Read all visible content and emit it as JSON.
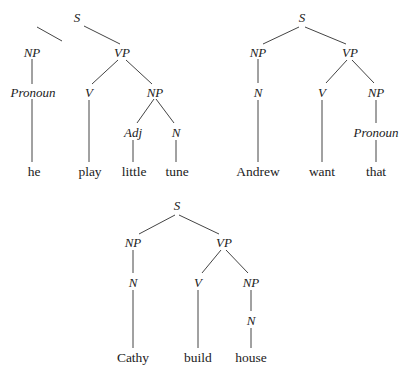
{
  "trees": [
    {
      "id": "tree-he-play-little-tune",
      "nodes": [
        {
          "id": "S",
          "label": "S",
          "type": "cat",
          "x": 77,
          "y": 17
        },
        {
          "id": "NP1",
          "label": "NP",
          "type": "cat",
          "x": 32,
          "y": 52
        },
        {
          "id": "VP",
          "label": "VP",
          "type": "cat",
          "x": 122,
          "y": 52
        },
        {
          "id": "Pron",
          "label": "Pronoun",
          "type": "cat",
          "x": 33,
          "y": 92
        },
        {
          "id": "V",
          "label": "V",
          "type": "cat",
          "x": 89,
          "y": 92
        },
        {
          "id": "NP2",
          "label": "NP",
          "type": "cat",
          "x": 155,
          "y": 92
        },
        {
          "id": "Adj",
          "label": "Adj",
          "type": "cat",
          "x": 133,
          "y": 132
        },
        {
          "id": "N",
          "label": "N",
          "type": "cat",
          "x": 176,
          "y": 132
        },
        {
          "id": "w1",
          "label": "he",
          "type": "word",
          "x": 34,
          "y": 172
        },
        {
          "id": "w2",
          "label": "play",
          "type": "word",
          "x": 90,
          "y": 172
        },
        {
          "id": "w3",
          "label": "little",
          "type": "word",
          "x": 134,
          "y": 172
        },
        {
          "id": "w4",
          "label": "tune",
          "type": "word",
          "x": 177,
          "y": 172
        }
      ],
      "edges": [
        [
          37,
          27,
          62,
          41,
          0
        ],
        [
          84,
          26,
          120,
          44,
          0
        ],
        [
          32,
          59,
          32,
          84,
          0
        ],
        [
          32,
          99,
          32,
          162,
          0
        ],
        [
          118,
          60,
          92,
          84,
          0
        ],
        [
          126,
          60,
          152,
          84,
          0
        ],
        [
          89,
          100,
          89,
          162,
          0
        ],
        [
          154,
          99,
          137,
          123,
          0
        ],
        [
          156,
          99,
          174,
          123,
          0
        ],
        [
          133,
          140,
          133,
          162,
          0
        ],
        [
          176,
          140,
          176,
          162,
          0
        ]
      ]
    },
    {
      "id": "tree-andrew-want-that",
      "nodes": [
        {
          "id": "S",
          "label": "S",
          "type": "cat",
          "x": 302,
          "y": 17
        },
        {
          "id": "NP1",
          "label": "NP",
          "type": "cat",
          "x": 258,
          "y": 52
        },
        {
          "id": "VP",
          "label": "VP",
          "type": "cat",
          "x": 350,
          "y": 52
        },
        {
          "id": "N",
          "label": "N",
          "type": "cat",
          "x": 258,
          "y": 92
        },
        {
          "id": "V",
          "label": "V",
          "type": "cat",
          "x": 322,
          "y": 92
        },
        {
          "id": "NP2",
          "label": "NP",
          "type": "cat",
          "x": 376,
          "y": 92
        },
        {
          "id": "Pron",
          "label": "Pronoun",
          "type": "cat",
          "x": 376,
          "y": 132
        },
        {
          "id": "w1",
          "label": "Andrew",
          "type": "word",
          "x": 258,
          "y": 172
        },
        {
          "id": "w2",
          "label": "want",
          "type": "word",
          "x": 322,
          "y": 172
        },
        {
          "id": "w3",
          "label": "that",
          "type": "word",
          "x": 376,
          "y": 172
        }
      ],
      "edges": [
        [
          299,
          27,
          263,
          44,
          0
        ],
        [
          305,
          27,
          346,
          44,
          0
        ],
        [
          258,
          59,
          258,
          83,
          0
        ],
        [
          258,
          100,
          258,
          162,
          0
        ],
        [
          347,
          60,
          326,
          83,
          0
        ],
        [
          352,
          60,
          374,
          83,
          0
        ],
        [
          322,
          100,
          322,
          162,
          0
        ],
        [
          376,
          100,
          376,
          123,
          0
        ],
        [
          376,
          140,
          376,
          162,
          0
        ]
      ]
    },
    {
      "id": "tree-cathy-build-house",
      "nodes": [
        {
          "id": "S",
          "label": "S",
          "type": "cat",
          "x": 177,
          "y": 205
        },
        {
          "id": "NP1",
          "label": "NP",
          "type": "cat",
          "x": 133,
          "y": 242
        },
        {
          "id": "VP",
          "label": "VP",
          "type": "cat",
          "x": 224,
          "y": 242
        },
        {
          "id": "N",
          "label": "N",
          "type": "cat",
          "x": 133,
          "y": 282
        },
        {
          "id": "V",
          "label": "V",
          "type": "cat",
          "x": 198,
          "y": 282
        },
        {
          "id": "NP2",
          "label": "NP",
          "type": "cat",
          "x": 251,
          "y": 282
        },
        {
          "id": "N2",
          "label": "N",
          "type": "cat",
          "x": 251,
          "y": 320
        },
        {
          "id": "w1",
          "label": "Cathy",
          "type": "word",
          "x": 133,
          "y": 358
        },
        {
          "id": "w2",
          "label": "build",
          "type": "word",
          "x": 198,
          "y": 358
        },
        {
          "id": "w3",
          "label": "house",
          "type": "word",
          "x": 251,
          "y": 358
        }
      ],
      "edges": [
        [
          175,
          215,
          139,
          234,
          0
        ],
        [
          179,
          215,
          219,
          234,
          0
        ],
        [
          133,
          250,
          133,
          273,
          0
        ],
        [
          133,
          290,
          133,
          348,
          0
        ],
        [
          221,
          250,
          202,
          273,
          0
        ],
        [
          226,
          250,
          248,
          273,
          0
        ],
        [
          198,
          290,
          198,
          348,
          0
        ],
        [
          251,
          290,
          251,
          311,
          0
        ],
        [
          251,
          328,
          251,
          348,
          0
        ]
      ]
    }
  ]
}
